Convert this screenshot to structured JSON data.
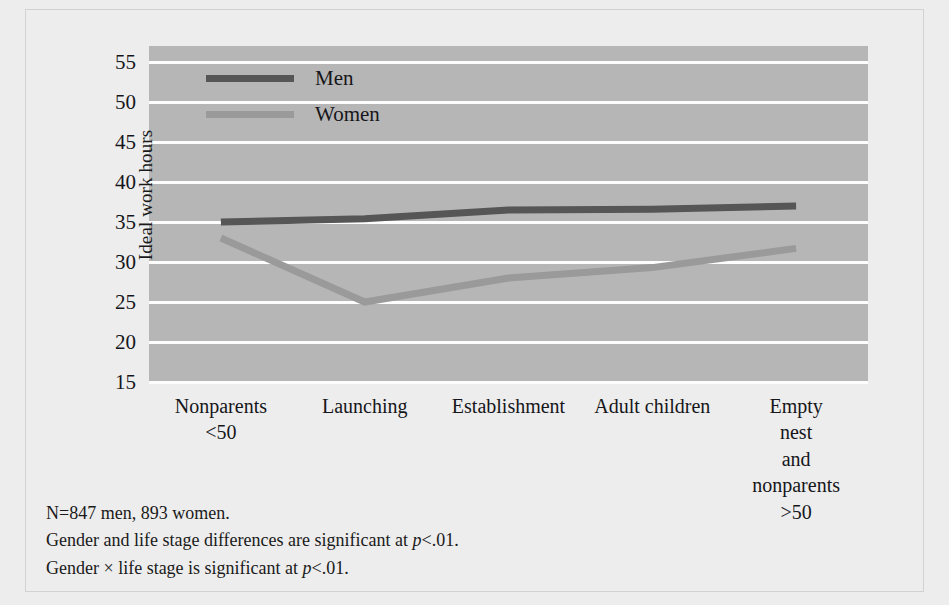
{
  "chart_data": {
    "type": "line",
    "title": "",
    "subtitle": "",
    "xlabel": "",
    "ylabel": "Ideal work hours",
    "categories": [
      "Nonparents\n<50",
      "Launching",
      "Establishment",
      "Adult children",
      "Empty nest\nand nonparents\n>50"
    ],
    "series": [
      {
        "name": "Men",
        "color": "#565656",
        "values": [
          35.0,
          35.4,
          36.5,
          36.6,
          37.0
        ]
      },
      {
        "name": "Women",
        "color": "#9a9a9a",
        "values": [
          33.0,
          25.0,
          28.0,
          29.3,
          31.7
        ]
      }
    ],
    "ylim": [
      15,
      57
    ],
    "yticks": [
      55,
      50,
      45,
      40,
      35,
      30,
      25,
      20,
      15
    ],
    "ytick_labels": [
      "55",
      "50",
      "45",
      "40",
      "35",
      "30",
      "25",
      "20",
      "15"
    ],
    "grid": true,
    "gridline_color": "#fdfdfd",
    "plot_background": "#b6b6b6",
    "legend_position": "top-left"
  },
  "legend": {
    "entries": [
      {
        "label": "Men",
        "color": "#565656"
      },
      {
        "label": "Women",
        "color": "#9a9a9a"
      }
    ]
  },
  "notes": {
    "line1": "N=847 men, 893 women.",
    "line2_pre": "Gender and life stage differences are significant at ",
    "line2_p": "p",
    "line2_post": "<.01.",
    "line3_pre": "Gender ",
    "line3_times": "×",
    "line3_mid": " life stage is significant at ",
    "line3_p": "p",
    "line3_post": "<.01."
  }
}
